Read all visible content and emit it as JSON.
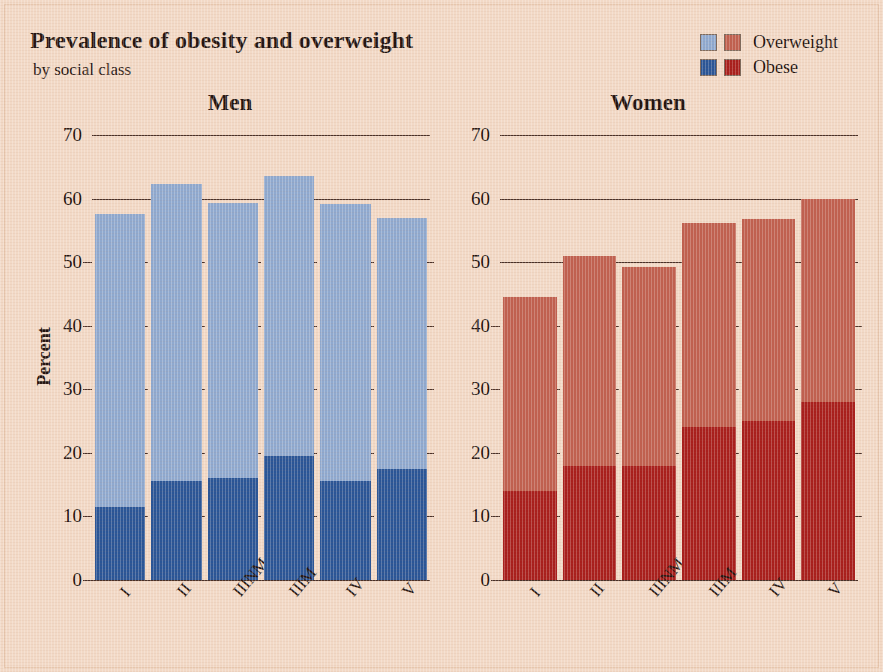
{
  "header": {
    "title": "Prevalence of obesity and overweight",
    "subtitle": "by social class"
  },
  "legend": {
    "items": [
      {
        "label": "Overweight",
        "color_men": "#8fa9cf",
        "color_women": "#c0604f"
      },
      {
        "label": "Obese",
        "color_men": "#2a5596",
        "color_women": "#a81f1c"
      }
    ]
  },
  "chart_data": [
    {
      "type": "bar",
      "title": "Men",
      "stacked": true,
      "categories": [
        "I",
        "II",
        "IIINM",
        "IIIM",
        "IV",
        "V"
      ],
      "series": [
        {
          "name": "Obese",
          "values": [
            11.5,
            15.5,
            16.0,
            19.5,
            15.5,
            17.5
          ],
          "color": "#2a5596"
        },
        {
          "name": "Overweight",
          "values": [
            46.0,
            46.8,
            43.3,
            44.0,
            43.7,
            39.5
          ],
          "color": "#8fa9cf"
        }
      ],
      "totals": [
        57.5,
        62.3,
        59.3,
        63.5,
        59.2,
        57.0
      ],
      "xlabel": "Social class of head of household",
      "ylabel": "Percent",
      "ylim": [
        0,
        70
      ],
      "yticks": [
        0,
        10,
        20,
        30,
        40,
        50,
        60,
        70
      ],
      "gridlines": [
        60,
        70
      ],
      "grid": true,
      "legend_position": "top-right"
    },
    {
      "type": "bar",
      "title": "Women",
      "stacked": true,
      "categories": [
        "I",
        "II",
        "IIINM",
        "IIIM",
        "IV",
        "V"
      ],
      "series": [
        {
          "name": "Obese",
          "values": [
            14.0,
            18.0,
            18.0,
            24.0,
            25.0,
            28.0
          ],
          "color": "#a81f1c"
        },
        {
          "name": "Overweight",
          "values": [
            30.5,
            33.0,
            31.2,
            32.2,
            31.8,
            32.0
          ],
          "color": "#c0604f"
        }
      ],
      "totals": [
        44.5,
        51.0,
        49.2,
        56.2,
        56.8,
        60.0
      ],
      "xlabel": "Social class of head of household",
      "ylabel": "",
      "ylim": [
        0,
        70
      ],
      "yticks": [
        0,
        10,
        20,
        30,
        40,
        50,
        60,
        70
      ],
      "gridlines": [
        50,
        60,
        70
      ],
      "grid": true,
      "legend_position": "top-right"
    }
  ]
}
